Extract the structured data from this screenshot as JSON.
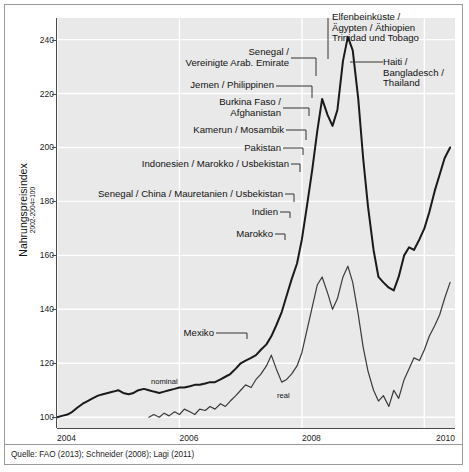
{
  "chart_data": {
    "type": "line",
    "title": "",
    "subtitle": "",
    "xlabel": "",
    "ylabel": "Nahrungspreisindex",
    "ylabel_sub": "2002-2004=100",
    "xlim": [
      2004.0,
      2010.5
    ],
    "ylim": [
      96,
      248
    ],
    "grid": true,
    "grid_axis": "both",
    "legend_position": "inline",
    "x_ticks": [
      "2004",
      "2006",
      "2008",
      "2010"
    ],
    "x_tick_values": [
      2004,
      2006,
      2008,
      2010
    ],
    "y_ticks": [
      "100",
      "120",
      "140",
      "160",
      "180",
      "200",
      "220",
      "240"
    ],
    "y_tick_values": [
      100,
      120,
      140,
      160,
      180,
      200,
      220,
      240
    ],
    "series": [
      {
        "name": "nominal",
        "inline_label": "nominal",
        "color": "#1a1a1a",
        "width": 2.0,
        "x": [
          2004.0,
          2004.08,
          2004.17,
          2004.25,
          2004.33,
          2004.42,
          2004.5,
          2004.58,
          2004.67,
          2004.75,
          2004.83,
          2004.92,
          2005.0,
          2005.08,
          2005.17,
          2005.25,
          2005.33,
          2005.42,
          2005.5,
          2005.58,
          2005.67,
          2005.75,
          2005.83,
          2005.92,
          2006.0,
          2006.08,
          2006.17,
          2006.25,
          2006.33,
          2006.42,
          2006.5,
          2006.58,
          2006.67,
          2006.75,
          2006.83,
          2006.92,
          2007.0,
          2007.08,
          2007.17,
          2007.25,
          2007.33,
          2007.42,
          2007.5,
          2007.58,
          2007.67,
          2007.75,
          2007.83,
          2007.92,
          2008.0,
          2008.08,
          2008.17,
          2008.25,
          2008.33,
          2008.42,
          2008.5,
          2008.58,
          2008.67,
          2008.75,
          2008.83,
          2008.92,
          2009.0,
          2009.08,
          2009.17,
          2009.25,
          2009.33,
          2009.42,
          2009.5,
          2009.58,
          2009.67,
          2009.75,
          2009.83,
          2009.92,
          2010.0,
          2010.08,
          2010.17,
          2010.25,
          2010.33,
          2010.42
        ],
        "values": [
          100,
          100.5,
          101,
          102,
          103.5,
          105,
          106,
          107,
          108,
          108.5,
          109,
          109.5,
          110,
          109,
          108.5,
          109,
          110,
          110.5,
          110,
          109.5,
          109,
          109.5,
          110,
          110.5,
          111,
          111,
          111.5,
          112,
          112,
          112.5,
          113,
          113,
          114,
          115,
          116,
          118,
          120,
          121,
          122,
          123,
          125,
          127,
          130,
          134,
          139,
          145,
          151,
          157,
          166,
          178,
          192,
          206,
          218,
          212,
          208,
          214,
          232,
          241,
          236,
          218,
          196,
          178,
          162,
          152,
          150,
          148,
          147,
          152,
          160,
          163,
          162,
          166,
          170,
          176,
          184,
          190,
          196,
          200
        ]
      },
      {
        "name": "real",
        "inline_label": "real",
        "color": "#3a3a3a",
        "width": 1.2,
        "x": [
          2005.5,
          2005.58,
          2005.67,
          2005.75,
          2005.83,
          2005.92,
          2006.0,
          2006.08,
          2006.17,
          2006.25,
          2006.33,
          2006.42,
          2006.5,
          2006.58,
          2006.67,
          2006.75,
          2006.83,
          2006.92,
          2007.0,
          2007.08,
          2007.17,
          2007.25,
          2007.33,
          2007.42,
          2007.5,
          2007.58,
          2007.67,
          2007.75,
          2007.83,
          2007.92,
          2008.0,
          2008.08,
          2008.17,
          2008.25,
          2008.33,
          2008.42,
          2008.5,
          2008.58,
          2008.67,
          2008.75,
          2008.83,
          2008.92,
          2009.0,
          2009.08,
          2009.17,
          2009.25,
          2009.33,
          2009.42,
          2009.5,
          2009.58,
          2009.67,
          2009.75,
          2009.83,
          2009.92,
          2010.0,
          2010.08,
          2010.17,
          2010.25,
          2010.33,
          2010.42
        ],
        "values": [
          100,
          101,
          100,
          101.5,
          100.5,
          102,
          101,
          103,
          102,
          101,
          103,
          102.5,
          104,
          103,
          105,
          104,
          106,
          108,
          110,
          112,
          111,
          114,
          116,
          119,
          123,
          118,
          113,
          114,
          116,
          119,
          124,
          132,
          141,
          149,
          152,
          146,
          140,
          144,
          152,
          156,
          150,
          138,
          126,
          117,
          110,
          106,
          108,
          104,
          110,
          107,
          114,
          118,
          122,
          121,
          125,
          130,
          134,
          138,
          144,
          150
        ]
      }
    ],
    "annotations": [
      {
        "id": "elfenbeinkueste",
        "text": "Elfenbeinküste /\nÄgypten / Äthiopien\nTrinidad und Tobago",
        "align": "left"
      },
      {
        "id": "haiti",
        "text": "Haiti /\nBangladesch /\nThailand",
        "align": "left"
      },
      {
        "id": "senegal-vae",
        "text": "Senegal /\nVereinigte Arab. Emirate",
        "align": "right"
      },
      {
        "id": "jemen-philippinen",
        "text": "Jemen / Philippinen",
        "align": "right"
      },
      {
        "id": "burkina-afghanistan",
        "text": "Burkina Faso /\nAfghanistan",
        "align": "right"
      },
      {
        "id": "kamerun-mosambik",
        "text": "Kamerun / Mosambik",
        "align": "right"
      },
      {
        "id": "pakistan",
        "text": "Pakistan",
        "align": "right"
      },
      {
        "id": "indonesien-marokko-usbekistan",
        "text": "Indonesien / Marokko / Usbekistan",
        "align": "right"
      },
      {
        "id": "senegal-china-mauretanien-usbekistan",
        "text": "Senegal / China / Mauretanien / Usbekistan",
        "align": "right"
      },
      {
        "id": "indien",
        "text": "Indien",
        "align": "right"
      },
      {
        "id": "marokko",
        "text": "Marokko",
        "align": "right"
      },
      {
        "id": "mexiko",
        "text": "Mexiko",
        "align": "right"
      }
    ]
  },
  "source": {
    "note": "Quelle: FAO (2013); Schneider (2008); Lagi (2011)"
  },
  "colors": {
    "plot_background": "#e9e9e9",
    "figure_background": "#ffffff",
    "gridline": "#ffffff",
    "axis": "#4a4a4a",
    "text": "#111111",
    "nominal_line": "#1a1a1a",
    "real_line": "#3a3a3a"
  }
}
